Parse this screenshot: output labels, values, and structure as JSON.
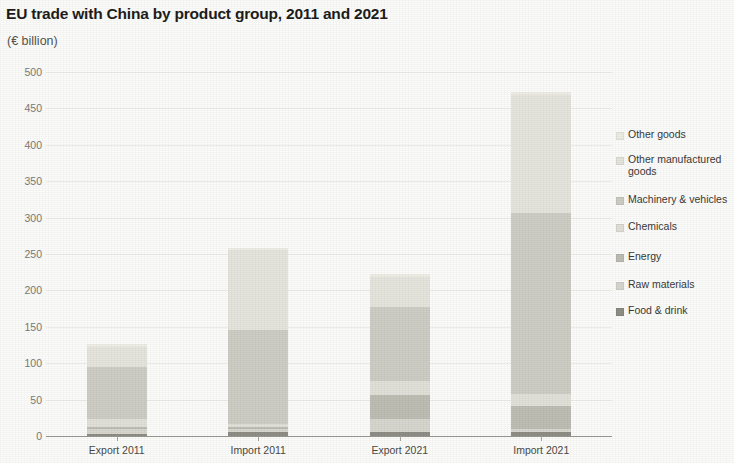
{
  "chart_data": {
    "type": "bar",
    "subtype": "stacked-bar",
    "title": "EU trade with China by product group, 2011 and 2021",
    "subtitle": "(€ billion)",
    "xlabel": "",
    "ylabel": "",
    "unit": "€ billion",
    "categories": [
      "Export 2011",
      "Import 2011",
      "Export 2021",
      "Import 2021"
    ],
    "ylim": [
      0,
      500
    ],
    "ytick_values": [
      0,
      50,
      100,
      150,
      200,
      250,
      300,
      350,
      400,
      450,
      500
    ],
    "ytick_labels": [
      "0",
      "50",
      "100",
      "150",
      "200",
      "250",
      "300",
      "350",
      "400",
      "450",
      "500"
    ],
    "grid": true,
    "legend_position": "right",
    "series": [
      {
        "name": "Food & drink",
        "color": "#8f8f88",
        "values": [
          3,
          6,
          5,
          6
        ]
      },
      {
        "name": "Raw materials",
        "color": "#d8d8d0",
        "values": [
          7,
          4,
          18,
          3
        ]
      },
      {
        "name": "Energy",
        "color": "#bfbfb6",
        "values": [
          2,
          2,
          33,
          32
        ]
      },
      {
        "name": "Chemicals",
        "color": "#e2e2da",
        "values": [
          11,
          5,
          19,
          17
        ]
      },
      {
        "name": "Machinery & vehicles",
        "color": "#cfcfc6",
        "values": [
          72,
          128,
          102,
          248
        ]
      },
      {
        "name": "Other manufactured goods",
        "color": "#e6e6de",
        "values": [
          28,
          110,
          42,
          162
        ]
      },
      {
        "name": "Other goods",
        "color": "#efefe8",
        "values": [
          3,
          3,
          3,
          4
        ]
      }
    ],
    "totals": [
      126,
      258,
      222,
      472
    ],
    "legend_entries": [
      "Other goods",
      "Other manufactured goods",
      "Machinery & vehicles",
      "Chemicals",
      "Energy",
      "Raw materials",
      "Food & drink"
    ]
  }
}
